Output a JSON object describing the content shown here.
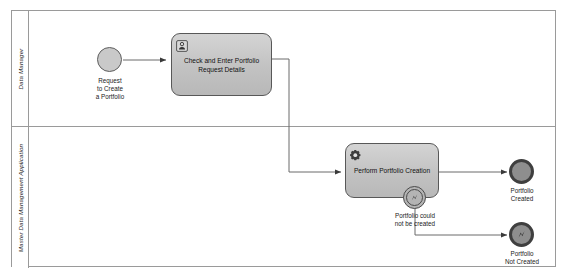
{
  "diagram": {
    "type": "bpmn-process-diagram",
    "title": "Create a Portfolio"
  },
  "pool": {
    "lanes": [
      {
        "id": "lane-data-manager",
        "label": "Data Manager"
      },
      {
        "id": "lane-mdm-application",
        "label": "Master Data Management Application"
      }
    ]
  },
  "events": {
    "start": {
      "id": "start-request-portfolio",
      "label": "Request\nto Create\na Portfolio",
      "icon": "start-event-icon",
      "type": "none-start-event"
    },
    "boundary_error": {
      "id": "boundary-portfolio-not-created",
      "label": "Portfolio could\nnot be created",
      "icon": "error-boundary-event-icon",
      "type": "error-boundary-event"
    },
    "end_created": {
      "id": "end-portfolio-created",
      "label": "Portfolio\nCreated",
      "icon": "end-event-icon",
      "type": "none-end-event"
    },
    "end_not_created": {
      "id": "end-portfolio-not-created",
      "label": "Portfolio\nNot Created",
      "icon": "error-end-event-icon",
      "type": "error-end-event"
    }
  },
  "tasks": {
    "check_enter": {
      "id": "task-check-and-enter",
      "label": "Check and Enter Portfolio\nRequest Details",
      "icon": "user-task-icon",
      "type": "user-task"
    },
    "perform_creation": {
      "id": "task-perform-portfolio-creation",
      "label": "Perform Portfolio Creation",
      "icon": "service-task-gear-icon",
      "type": "service-task"
    }
  },
  "colors": {
    "pool_border": "#9a9a9a",
    "shape_stroke": "#585858",
    "task_fill": "#c6c6c6",
    "event_fill": "#8e8e8e",
    "start_event_fill": "#c9c9c9",
    "connector": "#6b6b6b",
    "canvas": "#ffffff"
  }
}
